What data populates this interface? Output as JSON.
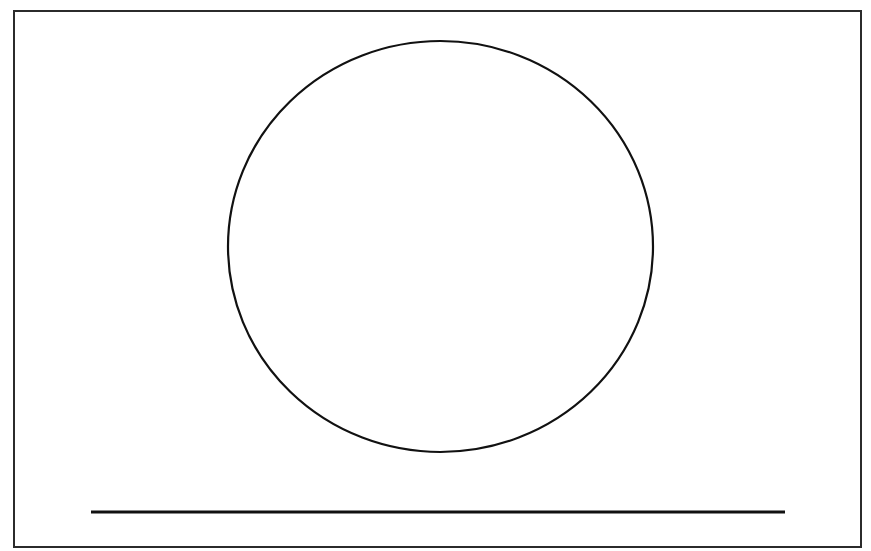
{
  "document": {
    "title": "Line drawing: circle above a horizontal baseline",
    "background_color": "#ffffff",
    "ink_color": "#111111",
    "width": 871,
    "height": 551
  },
  "chart_data": {
    "type": "line",
    "title": "Line drawing: circle above a horizontal baseline",
    "xlabel": "",
    "ylabel": "",
    "xlim": [
      0,
      871
    ],
    "ylim": [
      551,
      0
    ],
    "grid": false,
    "legend": "none",
    "shapes": [
      {
        "name": "frame",
        "kind": "rectangle",
        "x": 14,
        "y": 11,
        "width": 847,
        "height": 536,
        "stroke": "#2b2b2b",
        "stroke_width": 1.5,
        "fill": "none"
      },
      {
        "name": "circle",
        "kind": "ellipse",
        "cx": 440.5,
        "cy": 246.5,
        "rx": 212.5,
        "ry": 205.5,
        "stroke": "#111111",
        "stroke_width": 2.2,
        "fill": "none"
      },
      {
        "name": "baseline",
        "kind": "line",
        "x1": 91,
        "y1": 512,
        "x2": 785,
        "y2": 512,
        "stroke": "#111111",
        "stroke_width": 3.2
      }
    ]
  },
  "labels": {
    "frame": "outer frame border",
    "circle": "large circle outline",
    "baseline": "horizontal baseline segment"
  }
}
